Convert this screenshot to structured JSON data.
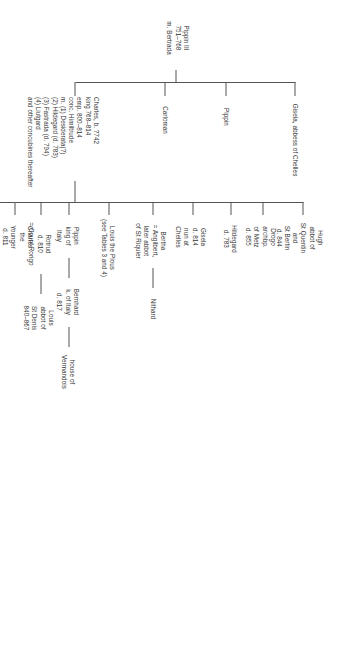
{
  "document": {
    "type": "genealogical-family-tree",
    "title_implied": "The Carolingians: descendants of Pippin III",
    "orientation": "rotated-90-degrees",
    "ink_color": "#333333",
    "rule_color": "#555555",
    "background_color": "#ffffff"
  },
  "root": {
    "name": "Pippin III",
    "reign": "751–768",
    "spouse": "m. Bertrada",
    "text": "Pippin III\n751–768\nm. Bertrada"
  },
  "generation2": [
    {
      "id": "charles",
      "label": "Charles, b. ?742\nking 768–814\nemp. 800–814\nconc. Himiltrude\nm. (1) Desiderata(?)\n(2) Hildegard (d. 783)\n(3) Fastrada (d. 794)\n(4) Liutgard\nand other concubines thereafter",
      "lines": [
        "Charles, b. ?742",
        "king 768–814",
        "emp. 800–814",
        "conc. Himiltrude",
        "m. (1) Desiderata(?)",
        "(2) Hildegard (d. 783)",
        "(3) Fastrada (d. 794)",
        "(4) Liutgard",
        "and other concubines thereafter"
      ]
    },
    {
      "id": "carloman",
      "label": "Carloman"
    },
    {
      "id": "pippin",
      "label": "Pippin"
    },
    {
      "id": "gisela-abbess",
      "label": "Gisela, abbess of Chelles"
    }
  ],
  "generation3": [
    {
      "id": "pippin-hunchback",
      "label": "Pippin\nthe\nHunchback\n(d. 811)"
    },
    {
      "id": "charles-younger",
      "label": "Charles\nthe\nYounger\nd. 811"
    },
    {
      "id": "rotrud",
      "label": "Rotrud\nd. 810\n= Count Rorigo"
    },
    {
      "id": "pippin-italy",
      "label": "Pippin\nking of\nItaly"
    },
    {
      "id": "louis-pious",
      "label": "Louis the Pious\n(see Tables 3 and 4)"
    },
    {
      "id": "bertha",
      "label": "Bertha\n= Angilbert,\nlater abbot\nof St Riquier"
    },
    {
      "id": "gisela-chelles",
      "label": "Gisela\nd. 814\nnun at\nChelles"
    },
    {
      "id": "hildegard",
      "label": "Hildegard\nd. 783"
    },
    {
      "id": "drogo",
      "label": "Drogo\narchbp.\nof Metz\nd. 855"
    },
    {
      "id": "hugh",
      "label": "Hugh\nabbot of\nSt Quentin\nand\nSt Bertin\nd. 844"
    }
  ],
  "generation4": [
    {
      "id": "louis-st-denis",
      "parent": "rotrud",
      "label": "Louis\nabbot of\nSt Denis\n840–867"
    },
    {
      "id": "bernhard",
      "parent": "pippin-italy",
      "label": "Bernhard\nk. of Italy\nd. 817"
    },
    {
      "id": "nithard",
      "parent": "bertha",
      "label": "Nithard"
    }
  ],
  "generation5": [
    {
      "id": "vermandois",
      "parent": "bernhard",
      "label": "house of\nVermandois"
    }
  ]
}
